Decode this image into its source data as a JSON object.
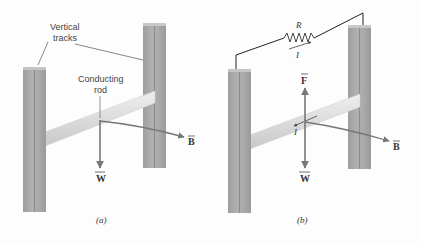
{
  "figure": {
    "panel_a": {
      "caption": "(a)",
      "labels": {
        "tracks_line1": "Vertical",
        "tracks_line2": "tracks",
        "rod_line1": "Conducting",
        "rod_line2": "rod"
      },
      "vectors": {
        "weight": "W",
        "field": "B"
      }
    },
    "panel_b": {
      "caption": "(b)",
      "labels": {
        "resistor": "R",
        "current_wire": "I",
        "current_rod": "I"
      },
      "vectors": {
        "force": "F",
        "weight": "W",
        "field": "B"
      }
    },
    "colors": {
      "track": "#a9a9a9",
      "track_dark": "#8f8f8f",
      "rod": "#dadada",
      "vector": "#777777",
      "wire": "#222222"
    }
  }
}
